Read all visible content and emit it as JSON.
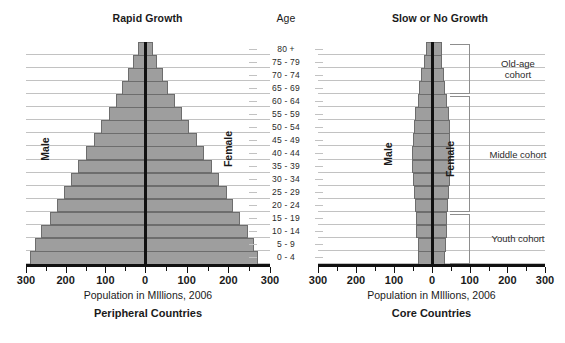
{
  "headers": {
    "left": "Rapid Growth",
    "age": "Age",
    "right": "Slow or No Growth"
  },
  "left_chart": {
    "subtitle": "Peripheral Countries",
    "axis_caption": "Population in MIllions, 2006",
    "male_label": "Male",
    "female_label": "Female"
  },
  "right_chart": {
    "subtitle": "Core Countries",
    "axis_caption": "Population in MIllions, 2006",
    "male_label": "Male",
    "female_label": "Female"
  },
  "cohorts": [
    {
      "label": "Old-age cohort",
      "lines": [
        "Old-age",
        "cohort"
      ]
    },
    {
      "label": "Middle cohort",
      "lines": [
        "Middle cohort"
      ]
    },
    {
      "label": "Youth cohort",
      "lines": [
        "Youth cohort"
      ]
    }
  ],
  "tick_labels": [
    "300",
    "200",
    "100",
    "0",
    "100",
    "200",
    "300"
  ],
  "colors": {
    "bar_fill": "#9e9e9e",
    "bar_stroke": "#6d6d6d",
    "axis": "#111111",
    "grid": "#c2c2c2"
  },
  "chart_data": {
    "type": "bar",
    "xlabel": "Population in MIllions, 2006",
    "ylabel": "Age",
    "xlim": [
      -300,
      300
    ],
    "xticks": [
      -300,
      -200,
      -100,
      0,
      100,
      200,
      300
    ],
    "xticklabels": [
      "300",
      "200",
      "100",
      "0",
      "100",
      "200",
      "300"
    ],
    "grid": true,
    "legend": null,
    "categories": [
      "0 - 4",
      "5 - 9",
      "10 - 14",
      "15 - 19",
      "20 - 24",
      "25 - 29",
      "30 - 34",
      "35 - 39",
      "40 - 44",
      "45 - 49",
      "50 - 54",
      "55 - 59",
      "60 - 64",
      "65 - 69",
      "70 - 74",
      "75 - 79",
      "80 +"
    ],
    "panels": [
      {
        "name": "Rapid Growth",
        "subtitle": "Peripheral Countries",
        "series": [
          {
            "name": "Male",
            "side": "left",
            "values": [
              290,
              278,
              262,
              240,
              222,
              205,
              186,
              168,
              148,
              128,
              110,
              92,
              74,
              58,
              44,
              30,
              18
            ]
          },
          {
            "name": "Female",
            "side": "right",
            "values": [
              272,
              262,
              248,
              228,
              212,
              196,
              178,
              160,
              142,
              124,
              106,
              88,
              72,
              56,
              42,
              29,
              20
            ]
          }
        ]
      },
      {
        "name": "Slow or No Growth",
        "subtitle": "Core Countries",
        "series": [
          {
            "name": "Male",
            "side": "left",
            "values": [
              36,
              38,
              41,
              43,
              45,
              47,
              50,
              52,
              52,
              50,
              48,
              44,
              38,
              33,
              28,
              22,
              16
            ]
          },
          {
            "name": "Female",
            "side": "right",
            "values": [
              34,
              36,
              39,
              41,
              43,
              45,
              48,
              50,
              51,
              49,
              47,
              44,
              39,
              35,
              31,
              26,
              26
            ]
          }
        ]
      }
    ],
    "annotations": [
      {
        "text": "Old-age cohort",
        "covers": [
          "65 - 69",
          "80 +"
        ]
      },
      {
        "text": "Middle cohort",
        "covers": [
          "20 - 24",
          "60 - 64"
        ]
      },
      {
        "text": "Youth cohort",
        "covers": [
          "0 - 4",
          "15 - 19"
        ]
      }
    ]
  }
}
